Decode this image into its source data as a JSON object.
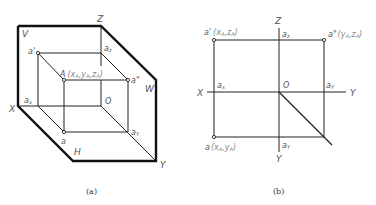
{
  "figure_a": {
    "caption": "(a)",
    "planes": {
      "V": "V",
      "H": "H",
      "W": "W"
    },
    "axes": {
      "X": "X",
      "Y": "Y",
      "Z": "Z",
      "O": "O"
    },
    "points": {
      "A": "A",
      "A_coords": "(x",
      "A_sub_x": "A",
      "A_comma1": ",y",
      "A_sub_y": "A",
      "A_comma2": ",z",
      "A_sub_z": "A",
      "A_close": ")",
      "a_prime": "a'",
      "a_double_prime": "a\"",
      "a": "a",
      "a_x": "a",
      "a_x_sub": "x",
      "a_y": "a",
      "a_y_sub": "Y",
      "a_z": "a",
      "a_z_sub": "z"
    }
  },
  "figure_b": {
    "caption": "(b)",
    "axes": {
      "X": "X",
      "Y_right": "Y",
      "Y_bottom": "Y",
      "Z": "Z",
      "O": "O"
    },
    "points": {
      "a_prime": "a'",
      "a_prime_coords": "(x",
      "a_prime_sub1": "A",
      "a_prime_mid": ",z",
      "a_prime_sub2": "A",
      "a_prime_close": ")",
      "a_double_prime": "a\"",
      "a_double_prime_coords": "(y",
      "a_double_prime_sub1": "A",
      "a_double_prime_mid": ",z",
      "a_double_prime_sub2": "A",
      "a_double_prime_close": ")",
      "a": "a",
      "a_coords": "(x",
      "a_sub1": "A",
      "a_mid": ",y",
      "a_sub2": "A",
      "a_close": ")",
      "a_x": "a",
      "a_x_sub": "x",
      "a_z": "a",
      "a_z_sub": "z",
      "a_y_right": "a",
      "a_y_right_sub": "Y",
      "a_y_bottom": "a",
      "a_y_bottom_sub": "Y"
    }
  }
}
